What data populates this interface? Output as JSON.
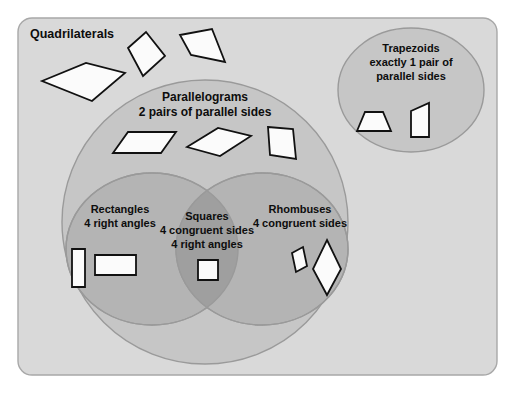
{
  "diagram": {
    "type": "venn-euler",
    "title_region": "Quadrilaterals",
    "canvas": {
      "width": 515,
      "height": 402,
      "background": "#ffffff"
    },
    "colors": {
      "page_background": "#ffffff",
      "universe_fill": "#d9d9d9",
      "universe_stroke": "#a8a8a8",
      "parallelogram_fill": "#c6c6c6",
      "rectangle_fill": "#b4b4b4",
      "rhombus_fill": "#b4b4b4",
      "square_overlap_fill": "#9f9f9f",
      "trapezoid_fill": "#c6c6c6",
      "region_stroke": "#9a9a9a",
      "shape_fill": "#fbfbfb",
      "shape_stroke": "#111111",
      "text_color": "#0d0d0d"
    },
    "regions": [
      {
        "id": "quadrilaterals",
        "name": "Quadrilaterals",
        "label_lines": [
          "Quadrilaterals"
        ],
        "shape": "rounded-rectangle",
        "geometry": {
          "x": 18,
          "y": 18,
          "width": 479,
          "height": 357,
          "rx": 14
        },
        "label_position": {
          "x": 30,
          "y": 38
        },
        "contains": [
          "parallelograms",
          "trapezoids"
        ]
      },
      {
        "id": "parallelograms",
        "name": "Parallelograms",
        "label_lines": [
          "Parallelograms",
          "2 pairs of parallel sides"
        ],
        "shape": "ellipse",
        "geometry": {
          "cx": 205,
          "cy": 222,
          "rx": 143,
          "ry": 142
        },
        "label_position": {
          "x": 205,
          "y": 101
        },
        "contains": [
          "rectangles",
          "rhombuses",
          "squares"
        ]
      },
      {
        "id": "rectangles",
        "name": "Rectangles",
        "label_lines": [
          "Rectangles",
          "4 right angles"
        ],
        "shape": "ellipse",
        "geometry": {
          "cx": 152,
          "cy": 249,
          "rx": 86,
          "ry": 76
        },
        "label_position": {
          "x": 120,
          "y": 213
        }
      },
      {
        "id": "rhombuses",
        "name": "Rhombuses",
        "label_lines": [
          "Rhombuses",
          "4 congruent sides"
        ],
        "shape": "ellipse",
        "geometry": {
          "cx": 262,
          "cy": 249,
          "rx": 86,
          "ry": 76
        },
        "label_position": {
          "x": 300,
          "y": 213
        }
      },
      {
        "id": "squares",
        "name": "Squares",
        "label_lines": [
          "Squares",
          "4 congruent sides",
          "4 right angles"
        ],
        "shape": "lens-intersection",
        "parents": [
          "rectangles",
          "rhombuses"
        ],
        "label_position": {
          "x": 207,
          "y": 220
        }
      },
      {
        "id": "trapezoids",
        "name": "Trapezoids",
        "label_lines": [
          "Trapezoids",
          "exactly 1 pair of",
          "parallel sides"
        ],
        "shape": "ellipse",
        "geometry": {
          "cx": 411,
          "cy": 90,
          "rx": 73,
          "ry": 62
        },
        "label_position": {
          "x": 411,
          "y": 52
        }
      }
    ],
    "example_shapes": [
      {
        "id": "quad-1",
        "region": "quadrilaterals",
        "name": "irregular-quadrilateral",
        "points": "42,81 86,63 125,73 92,101"
      },
      {
        "id": "quad-2",
        "region": "quadrilaterals",
        "name": "kite-quadrilateral",
        "points": "128,48 146,32 165,56 143,76"
      },
      {
        "id": "quad-3",
        "region": "quadrilaterals",
        "name": "trapezium-quadrilateral",
        "points": "180,35 212,29 225,62 191,55"
      },
      {
        "id": "para-1",
        "region": "parallelograms",
        "name": "parallelogram-flat",
        "points": "113,153 128,132 176,132 161,153"
      },
      {
        "id": "para-2",
        "region": "parallelograms",
        "name": "parallelogram-tilted",
        "points": "187,147 218,128 251,136 220,156"
      },
      {
        "id": "para-3",
        "region": "parallelograms",
        "name": "parallelogram-upright",
        "points": "268,127 293,129 296,159 270,155"
      },
      {
        "id": "rect-1",
        "region": "rectangles",
        "name": "rectangle-vertical",
        "points": "72,249 85,249 85,287 72,287"
      },
      {
        "id": "rect-2",
        "region": "rectangles",
        "name": "rectangle-horizontal",
        "points": "95,255 136,255 136,275 95,275"
      },
      {
        "id": "sq-1",
        "region": "squares",
        "name": "square",
        "points": "198,260 218,260 218,280 198,280"
      },
      {
        "id": "rhom-1",
        "region": "rhombuses",
        "name": "rhombus-small",
        "points": "292,253 303,247 307,266 296,272"
      },
      {
        "id": "rhom-2",
        "region": "rhombuses",
        "name": "rhombus-diamond",
        "points": "327,240 341,269 327,295 313,269"
      },
      {
        "id": "trap-1",
        "region": "trapezoids",
        "name": "trapezoid-isosceles",
        "points": "365,112 383,112 391,131 357,131"
      },
      {
        "id": "trap-2",
        "region": "trapezoids",
        "name": "trapezoid-right",
        "points": "411,137 411,111 429,103 429,137"
      }
    ]
  }
}
